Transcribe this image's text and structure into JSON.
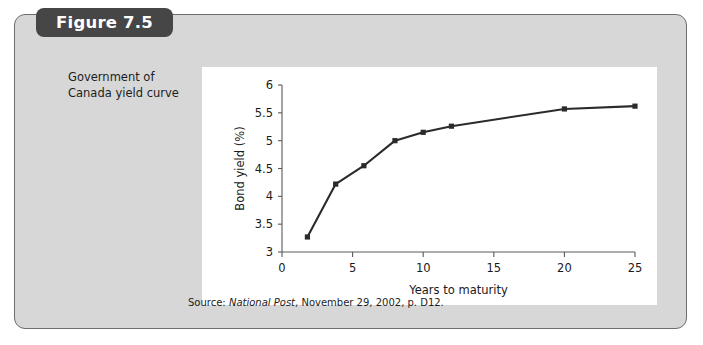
{
  "figure": {
    "tab_label": "Figure 7.5",
    "caption": "Government of Canada yield curve",
    "source_prefix": "Source:",
    "source_italic": "National Post",
    "source_rest": ", November 29, 2002, p. D12."
  },
  "colors": {
    "frame_background": "#d7d7d7",
    "frame_border": "#6e6e6e",
    "tab_background": "#464646",
    "tab_text": "#ffffff",
    "panel_background": "#ffffff",
    "series_line": "#2b2b2b",
    "axis": "#5a5a5a",
    "text": "#1a1a1a"
  },
  "chart_data": {
    "type": "line",
    "title": "",
    "xlabel": "Years to maturity",
    "ylabel": "Bond yield (%)",
    "xlim": [
      0,
      25
    ],
    "ylim": [
      3,
      6
    ],
    "xticks": [
      0,
      5,
      10,
      15,
      20,
      25
    ],
    "xtick_labels": [
      "0",
      "5",
      "10",
      "15",
      "20",
      "25"
    ],
    "yticks": [
      3,
      3.5,
      4,
      4.5,
      5,
      5.5,
      6
    ],
    "ytick_labels": [
      "3",
      "3.5",
      "4",
      "4.5",
      "5",
      "5.5",
      "6"
    ],
    "grid": false,
    "legend": false,
    "marker": "square",
    "series": [
      {
        "name": "Government of Canada yield curve",
        "x": [
          1.8,
          3.8,
          5.8,
          8.0,
          10.0,
          12.0,
          20.0,
          25.0
        ],
        "values": [
          3.27,
          4.22,
          4.55,
          5.0,
          5.15,
          5.26,
          5.57,
          5.62
        ]
      }
    ]
  }
}
